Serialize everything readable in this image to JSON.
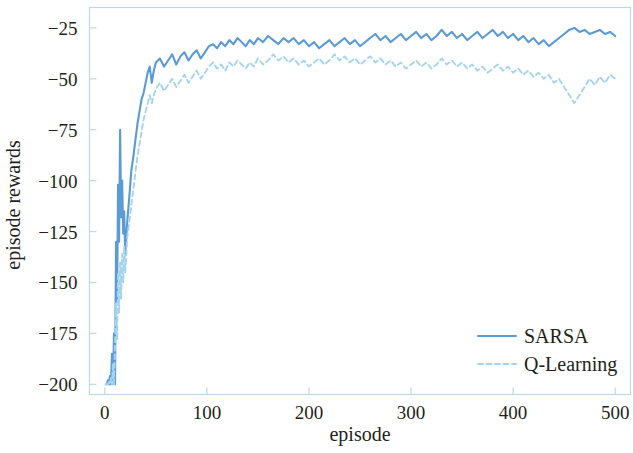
{
  "chart_data": {
    "type": "line",
    "title": "",
    "xlabel": "episode",
    "ylabel": "episode rewards",
    "xlim": [
      -15,
      515
    ],
    "ylim": [
      -205,
      -15
    ],
    "xticks": [
      0,
      100,
      200,
      300,
      400,
      500
    ],
    "xtick_labels": [
      "0",
      "100",
      "200",
      "300",
      "400",
      "500"
    ],
    "yticks": [
      -200,
      -175,
      -150,
      -125,
      -100,
      -75,
      -50,
      -25
    ],
    "ytick_labels": [
      "−200",
      "−175",
      "−150",
      "−125",
      "−100",
      "−75",
      "−50",
      "−25"
    ],
    "grid": false,
    "legend_position": "lower right",
    "colors": {
      "sarsa": "#5b9bd5",
      "qlearning": "#a6d4ee",
      "axis": "#bcd8ea",
      "text": "#231f20",
      "background": "#ffffff"
    },
    "series": [
      {
        "name": "SARSA",
        "style": "solid",
        "color": "#5b9bd5",
        "x": [
          1,
          2,
          3,
          4,
          5,
          6,
          7,
          8,
          9,
          10,
          11,
          12,
          13,
          14,
          15,
          16,
          17,
          18,
          19,
          20,
          22,
          24,
          26,
          28,
          30,
          32,
          34,
          36,
          38,
          40,
          42,
          44,
          46,
          48,
          50,
          54,
          58,
          62,
          66,
          70,
          74,
          78,
          82,
          86,
          90,
          94,
          98,
          102,
          106,
          110,
          114,
          118,
          122,
          126,
          130,
          134,
          138,
          142,
          146,
          150,
          155,
          160,
          165,
          170,
          175,
          180,
          185,
          190,
          195,
          200,
          205,
          210,
          215,
          220,
          225,
          230,
          235,
          240,
          245,
          250,
          255,
          260,
          265,
          270,
          275,
          280,
          285,
          290,
          295,
          300,
          305,
          310,
          315,
          320,
          325,
          330,
          335,
          340,
          345,
          350,
          355,
          360,
          365,
          370,
          375,
          380,
          385,
          390,
          395,
          400,
          405,
          410,
          415,
          420,
          425,
          430,
          435,
          440,
          445,
          450,
          455,
          460,
          465,
          470,
          475,
          480,
          485,
          490,
          495,
          500
        ],
        "y": [
          -200,
          -200,
          -198,
          -200,
          -196,
          -200,
          -185,
          -200,
          -175,
          -200,
          -130,
          -160,
          -102,
          -130,
          -75,
          -118,
          -100,
          -126,
          -115,
          -136,
          -120,
          -108,
          -95,
          -88,
          -80,
          -72,
          -66,
          -60,
          -57,
          -52,
          -47,
          -44,
          -52,
          -46,
          -42,
          -40,
          -44,
          -41,
          -38,
          -43,
          -39,
          -37,
          -41,
          -38,
          -36,
          -40,
          -37,
          -34,
          -33,
          -35,
          -32,
          -34,
          -31,
          -33,
          -30,
          -32,
          -34,
          -31,
          -33,
          -30,
          -32,
          -29,
          -31,
          -33,
          -30,
          -32,
          -30,
          -33,
          -31,
          -34,
          -32,
          -35,
          -33,
          -31,
          -34,
          -32,
          -30,
          -33,
          -31,
          -34,
          -32,
          -30,
          -28,
          -31,
          -29,
          -32,
          -30,
          -28,
          -31,
          -29,
          -27,
          -30,
          -28,
          -31,
          -29,
          -26,
          -29,
          -27,
          -30,
          -28,
          -31,
          -29,
          -27,
          -30,
          -28,
          -26,
          -29,
          -27,
          -30,
          -28,
          -31,
          -29,
          -32,
          -30,
          -33,
          -31,
          -34,
          -32,
          -30,
          -28,
          -26,
          -25,
          -27,
          -26,
          -28,
          -27,
          -26,
          -28,
          -27,
          -29
        ]
      },
      {
        "name": "Q-Learning",
        "style": "dashed",
        "color": "#a6d4ee",
        "x": [
          1,
          2,
          3,
          4,
          5,
          6,
          7,
          8,
          9,
          10,
          11,
          12,
          13,
          14,
          15,
          16,
          17,
          18,
          19,
          20,
          22,
          24,
          26,
          28,
          30,
          32,
          34,
          36,
          38,
          40,
          42,
          44,
          46,
          48,
          50,
          54,
          58,
          62,
          66,
          70,
          74,
          78,
          82,
          86,
          90,
          94,
          98,
          102,
          106,
          110,
          114,
          118,
          122,
          126,
          130,
          134,
          138,
          142,
          146,
          150,
          155,
          160,
          165,
          170,
          175,
          180,
          185,
          190,
          195,
          200,
          205,
          210,
          215,
          220,
          225,
          230,
          235,
          240,
          245,
          250,
          255,
          260,
          265,
          270,
          275,
          280,
          285,
          290,
          295,
          300,
          305,
          310,
          315,
          320,
          325,
          330,
          335,
          340,
          345,
          350,
          355,
          360,
          365,
          370,
          375,
          380,
          385,
          390,
          395,
          400,
          405,
          410,
          415,
          420,
          425,
          430,
          435,
          440,
          445,
          450,
          455,
          460,
          465,
          470,
          475,
          480,
          485,
          490,
          495,
          500
        ],
        "y": [
          -200,
          -200,
          -200,
          -199,
          -200,
          -197,
          -200,
          -190,
          -200,
          -180,
          -160,
          -178,
          -145,
          -165,
          -140,
          -158,
          -136,
          -150,
          -132,
          -145,
          -128,
          -120,
          -112,
          -104,
          -96,
          -88,
          -82,
          -76,
          -70,
          -66,
          -62,
          -58,
          -62,
          -58,
          -55,
          -52,
          -56,
          -53,
          -50,
          -54,
          -51,
          -48,
          -52,
          -49,
          -46,
          -50,
          -47,
          -44,
          -42,
          -45,
          -43,
          -46,
          -42,
          -44,
          -41,
          -43,
          -45,
          -42,
          -44,
          -40,
          -43,
          -41,
          -38,
          -41,
          -39,
          -42,
          -40,
          -43,
          -41,
          -44,
          -42,
          -40,
          -43,
          -41,
          -38,
          -41,
          -39,
          -42,
          -40,
          -43,
          -41,
          -39,
          -42,
          -40,
          -43,
          -41,
          -44,
          -42,
          -45,
          -43,
          -41,
          -44,
          -42,
          -45,
          -43,
          -40,
          -43,
          -41,
          -44,
          -42,
          -45,
          -43,
          -46,
          -44,
          -47,
          -45,
          -43,
          -46,
          -44,
          -47,
          -45,
          -48,
          -46,
          -49,
          -47,
          -50,
          -48,
          -52,
          -50,
          -54,
          -58,
          -62,
          -58,
          -54,
          -50,
          -53,
          -49,
          -52,
          -48,
          -50
        ]
      }
    ]
  },
  "legend": {
    "items": [
      {
        "label": "SARSA",
        "style": "solid",
        "color": "#5b9bd5"
      },
      {
        "label": "Q-Learning",
        "style": "dashed",
        "color": "#a6d4ee"
      }
    ]
  },
  "axes": {
    "x_title": "episode",
    "y_title": "episode rewards"
  }
}
